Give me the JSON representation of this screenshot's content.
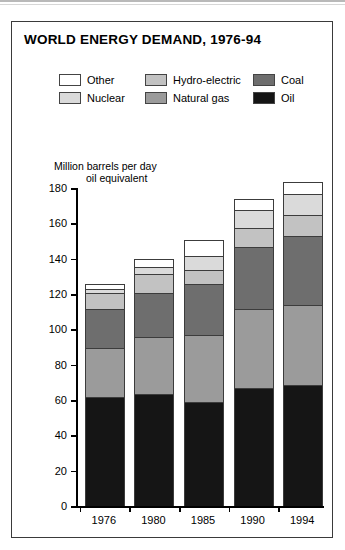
{
  "title": "WORLD ENERGY DEMAND, 1976-94",
  "legend": {
    "items": [
      {
        "label": "Other",
        "color": "#ffffff"
      },
      {
        "label": "Hydro-electric",
        "color": "#c2c2c2"
      },
      {
        "label": "Coal",
        "color": "#6e6e6e"
      },
      {
        "label": "Nuclear",
        "color": "#dadada"
      },
      {
        "label": "Natural gas",
        "color": "#9b9b9b"
      },
      {
        "label": "Oil",
        "color": "#151515"
      }
    ]
  },
  "chart_data": {
    "type": "bar",
    "stacked": true,
    "title": "WORLD ENERGY DEMAND, 1976-94",
    "xlabel": "",
    "ylabel": "Million barrels per day",
    "ylabel_line2": "oil equivalent",
    "ylim": [
      0,
      180
    ],
    "yticks": [
      0,
      20,
      40,
      60,
      80,
      100,
      120,
      140,
      160,
      180
    ],
    "grid": false,
    "legend_position": "top",
    "categories": [
      "1976",
      "1980",
      "1985",
      "1990",
      "1994"
    ],
    "series": [
      {
        "name": "Oil",
        "color": "#151515",
        "values": [
          61,
          63,
          58,
          66,
          68
        ]
      },
      {
        "name": "Natural gas",
        "color": "#9b9b9b",
        "values": [
          28,
          32,
          38,
          45,
          45
        ]
      },
      {
        "name": "Coal",
        "color": "#6e6e6e",
        "values": [
          22,
          25,
          29,
          35,
          39
        ]
      },
      {
        "name": "Hydro-electric",
        "color": "#c2c2c2",
        "values": [
          9,
          11,
          8,
          11,
          12
        ]
      },
      {
        "name": "Nuclear",
        "color": "#dadada",
        "values": [
          2,
          4,
          8,
          10,
          12
        ]
      },
      {
        "name": "Other",
        "color": "#ffffff",
        "values": [
          3,
          4,
          9,
          6,
          7
        ]
      }
    ],
    "totals": [
      125,
      139,
      150,
      173,
      183
    ]
  }
}
